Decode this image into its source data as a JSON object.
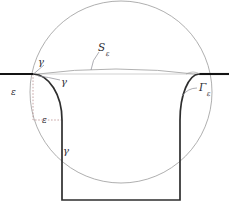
{
  "figure": {
    "type": "contour-deformation-diagram",
    "canvas": {
      "width": 229,
      "height": 212
    },
    "colors": {
      "axis": "#1a1a1a",
      "contour": "#2a2a2a",
      "circle": "#8c8c8c",
      "arc_light": "#a8a8a8",
      "dotted": "#b08a8a",
      "leader": "#8a8a92",
      "text": "#2b2b33",
      "background": "#ffffff"
    },
    "labels": [
      {
        "id": "gamma-top-left",
        "text": "γ",
        "x": 38,
        "y": 62,
        "kind": "gamma"
      },
      {
        "id": "gamma-inner-left",
        "text": "γ",
        "x": 61,
        "y": 82,
        "kind": "gamma"
      },
      {
        "id": "gamma-bottom",
        "text": "γ",
        "x": 63,
        "y": 151,
        "kind": "gamma"
      },
      {
        "id": "epsilon-vertical",
        "text": "ε",
        "x": 11,
        "y": 92,
        "kind": "epsilon"
      },
      {
        "id": "epsilon-horizontal",
        "text": "ε",
        "x": 42,
        "y": 120,
        "kind": "epsilon"
      }
    ],
    "big_labels": [
      {
        "id": "S-epsilon",
        "base": "S",
        "sub": "ε",
        "x": 98,
        "y": 48
      },
      {
        "id": "Gamma-epsilon",
        "base": "Γ",
        "sub": "ε",
        "x": 199,
        "y": 88
      }
    ],
    "geometry": {
      "axis_y": 74,
      "axis_left_segment": [
        0,
        33
      ],
      "axis_right_segment": [
        199,
        229
      ],
      "box_left_x": 62,
      "box_right_x": 180,
      "box_bottom_y": 200,
      "corner_radius_epsilon": 30,
      "big_circle_center": [
        121,
        92
      ],
      "big_circle_radius": 91,
      "s_epsilon_arc": {
        "from": [
          33,
          74
        ],
        "to": [
          199,
          74
        ],
        "peak_y": 67
      }
    }
  }
}
